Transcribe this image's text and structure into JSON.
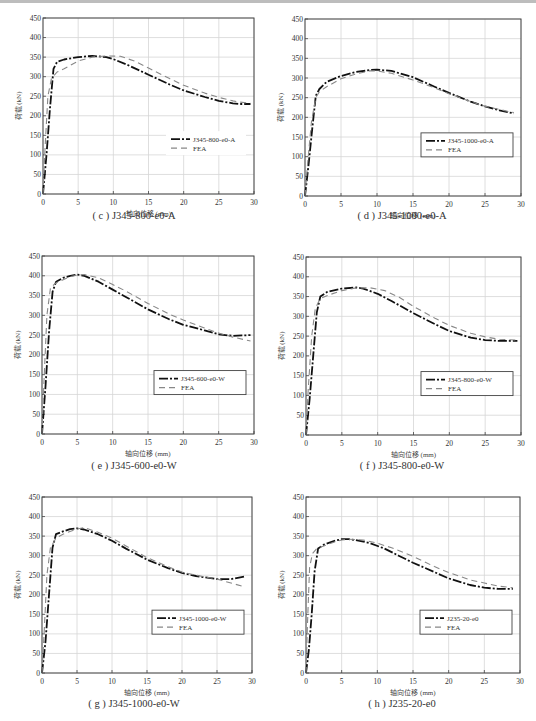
{
  "figure": {
    "caption_partial": "图 — 轴心受压构件荷载-轴向位移曲线试验与有限元对比",
    "xlabel": "轴向位移 (mm)",
    "ylabel": "荷载 (kN)"
  },
  "panels": [
    {
      "id": "c",
      "caption": "( c ) J345-800-e0-A",
      "legend": [
        "J345-800-e0-A",
        "FEA"
      ],
      "legend_box": false
    },
    {
      "id": "d",
      "caption": "( d ) J345-1000-e0-A",
      "legend": [
        "J345-1000-e0-A",
        "FEA"
      ],
      "legend_box": true
    },
    {
      "id": "e",
      "caption": "( e ) J345-600-e0-W",
      "legend": [
        "J345-600-e0-W",
        "FEA"
      ],
      "legend_box": true
    },
    {
      "id": "f",
      "caption": "( f ) J345-800-e0-W",
      "legend": [
        "J345-800-e0-W",
        "FEA"
      ],
      "legend_box": true
    },
    {
      "id": "g",
      "caption": "( g ) J345-1000-e0-W",
      "legend": [
        "J345-1000-e0-W",
        "FEA"
      ],
      "legend_box": true
    },
    {
      "id": "h",
      "caption": "( h ) J235-20-e0",
      "legend": [
        "J235-20-e0",
        "FEA"
      ],
      "legend_box": true
    }
  ],
  "chart_data": [
    {
      "type": "line",
      "title": "(c) J345-800-e0-A",
      "xlabel": "轴向位移 (mm)",
      "ylabel": "荷载 (kN)",
      "xlim": [
        0,
        30
      ],
      "ylim": [
        0,
        450
      ],
      "xticks": [
        0,
        5,
        10,
        15,
        20,
        25,
        30
      ],
      "yticks": [
        0,
        50,
        100,
        150,
        200,
        250,
        300,
        350,
        400,
        450
      ],
      "grid": true,
      "legend_position": "lower right",
      "series": [
        {
          "name": "J345-800-e0-A",
          "style": "dash-dot",
          "x": [
            0,
            0.5,
            1,
            1.5,
            2,
            3,
            5,
            7,
            9,
            10,
            12,
            15,
            18,
            20,
            23,
            25,
            27,
            28,
            29.5
          ],
          "y": [
            0,
            100,
            220,
            320,
            338,
            344,
            350,
            353,
            350,
            345,
            330,
            305,
            280,
            265,
            248,
            238,
            232,
            230,
            230
          ]
        },
        {
          "name": "FEA",
          "style": "dashed",
          "x": [
            0,
            0.3,
            0.7,
            1.2,
            2,
            3,
            5,
            7,
            9,
            11,
            13,
            15,
            18,
            20,
            23,
            25,
            27,
            28,
            29.5
          ],
          "y": [
            0,
            120,
            250,
            295,
            312,
            320,
            340,
            350,
            353,
            352,
            340,
            322,
            295,
            278,
            258,
            247,
            238,
            235,
            232
          ]
        }
      ]
    },
    {
      "type": "line",
      "title": "(d) J345-1000-e0-A",
      "xlabel": "轴向位移 (mm)",
      "ylabel": "荷载 (kN)",
      "xlim": [
        0,
        30
      ],
      "ylim": [
        0,
        450
      ],
      "xticks": [
        0,
        5,
        10,
        15,
        20,
        25,
        30
      ],
      "yticks": [
        0,
        50,
        100,
        150,
        200,
        250,
        300,
        350,
        400,
        450
      ],
      "grid": true,
      "legend_position": "lower right",
      "series": [
        {
          "name": "J345-1000-e0-A",
          "style": "dash-dot",
          "x": [
            0,
            0.5,
            1,
            1.5,
            2,
            3,
            5,
            7,
            9,
            10,
            12,
            15,
            18,
            20,
            23,
            25,
            27,
            29
          ],
          "y": [
            0,
            80,
            170,
            255,
            272,
            290,
            305,
            315,
            320,
            321,
            318,
            302,
            278,
            262,
            240,
            228,
            218,
            210
          ]
        },
        {
          "name": "FEA",
          "style": "dashed",
          "x": [
            0,
            0.4,
            0.9,
            1.5,
            2,
            3,
            5,
            7,
            9,
            10,
            12,
            15,
            18,
            20,
            23,
            25,
            27,
            29
          ],
          "y": [
            0,
            90,
            190,
            250,
            265,
            278,
            298,
            310,
            318,
            318,
            312,
            295,
            275,
            260,
            240,
            228,
            220,
            212
          ]
        }
      ]
    },
    {
      "type": "line",
      "title": "(e) J345-600-e0-W",
      "xlabel": "轴向位移 (mm)",
      "ylabel": "荷载 (kN)",
      "xlim": [
        0,
        30
      ],
      "ylim": [
        0,
        450
      ],
      "xticks": [
        0,
        5,
        10,
        15,
        20,
        25,
        30
      ],
      "yticks": [
        0,
        50,
        100,
        150,
        200,
        250,
        300,
        350,
        400,
        450
      ],
      "grid": true,
      "legend_position": "lower right",
      "series": [
        {
          "name": "J345-600-e0-W",
          "style": "dash-dot",
          "x": [
            0,
            0.5,
            1,
            1.5,
            2,
            3,
            4,
            5,
            6,
            8,
            10,
            12,
            15,
            18,
            20,
            23,
            25,
            27,
            29.5
          ],
          "y": [
            0,
            120,
            260,
            360,
            385,
            395,
            400,
            403,
            400,
            385,
            365,
            345,
            315,
            290,
            276,
            262,
            252,
            248,
            250
          ]
        },
        {
          "name": "FEA",
          "style": "dashed",
          "x": [
            0,
            0.3,
            0.7,
            1.2,
            2,
            3,
            4,
            5,
            6,
            8,
            10,
            12,
            15,
            18,
            20,
            23,
            25,
            27,
            29.5
          ],
          "y": [
            0,
            140,
            300,
            370,
            382,
            390,
            398,
            402,
            403,
            395,
            378,
            360,
            330,
            303,
            288,
            268,
            255,
            245,
            235
          ]
        }
      ]
    },
    {
      "type": "line",
      "title": "(f) J345-800-e0-W",
      "xlabel": "轴向位移 (mm)",
      "ylabel": "荷载 (kN)",
      "xlim": [
        0,
        30
      ],
      "ylim": [
        0,
        450
      ],
      "xticks": [
        0,
        5,
        10,
        15,
        20,
        25,
        30
      ],
      "yticks": [
        0,
        50,
        100,
        150,
        200,
        250,
        300,
        350,
        400,
        450
      ],
      "grid": true,
      "legend_position": "lower right",
      "series": [
        {
          "name": "J345-800-e0-W",
          "style": "dash-dot",
          "x": [
            0,
            0.5,
            1,
            1.5,
            2,
            3,
            5,
            7,
            8,
            10,
            12,
            15,
            18,
            20,
            23,
            25,
            27,
            29.5
          ],
          "y": [
            0,
            90,
            200,
            310,
            350,
            362,
            370,
            373,
            370,
            357,
            338,
            308,
            280,
            263,
            246,
            240,
            238,
            238
          ]
        },
        {
          "name": "FEA",
          "style": "dashed",
          "x": [
            0,
            0.3,
            0.8,
            1.3,
            2,
            3,
            5,
            7,
            9,
            11,
            13,
            15,
            18,
            20,
            23,
            25,
            27,
            29.5
          ],
          "y": [
            0,
            110,
            250,
            320,
            345,
            353,
            365,
            372,
            372,
            365,
            348,
            325,
            295,
            277,
            257,
            248,
            242,
            240
          ]
        }
      ]
    },
    {
      "type": "line",
      "title": "(g) J345-1000-e0-W",
      "xlabel": "轴向位移 (mm)",
      "ylabel": "荷载 (kN)",
      "xlim": [
        0,
        30
      ],
      "ylim": [
        0,
        450
      ],
      "xticks": [
        0,
        5,
        10,
        15,
        20,
        25,
        30
      ],
      "yticks": [
        0,
        50,
        100,
        150,
        200,
        250,
        300,
        350,
        400,
        450
      ],
      "grid": true,
      "legend_position": "lower right",
      "series": [
        {
          "name": "J345-1000-e0-W",
          "style": "dash-dot",
          "x": [
            0,
            0.5,
            1,
            1.5,
            2,
            3,
            4,
            5,
            6,
            8,
            10,
            12,
            15,
            18,
            20,
            22,
            25,
            27,
            29
          ],
          "y": [
            0,
            80,
            200,
            320,
            355,
            362,
            368,
            370,
            367,
            355,
            338,
            318,
            290,
            268,
            256,
            248,
            240,
            240,
            247
          ]
        },
        {
          "name": "FEA",
          "style": "dashed",
          "x": [
            0,
            0.3,
            0.7,
            1.2,
            2,
            3,
            4,
            5,
            6,
            8,
            10,
            12,
            15,
            18,
            20,
            22,
            25,
            27,
            29
          ],
          "y": [
            0,
            100,
            250,
            320,
            345,
            355,
            362,
            368,
            372,
            360,
            345,
            325,
            295,
            272,
            258,
            250,
            240,
            230,
            220
          ]
        }
      ]
    },
    {
      "type": "line",
      "title": "(h) J235-20-e0",
      "xlabel": "轴向位移 (mm)",
      "ylabel": "荷载 (kN)",
      "xlim": [
        0,
        30
      ],
      "ylim": [
        0,
        450
      ],
      "xticks": [
        0,
        5,
        10,
        15,
        20,
        25,
        30
      ],
      "yticks": [
        0,
        50,
        100,
        150,
        200,
        250,
        300,
        350,
        400,
        450
      ],
      "grid": true,
      "legend_position": "lower right",
      "series": [
        {
          "name": "J235-20-e0",
          "style": "dash-dot",
          "x": [
            0,
            0.4,
            0.8,
            1.2,
            1.7,
            2.5,
            4,
            5,
            6,
            7,
            9,
            11,
            13,
            15,
            18,
            20,
            23,
            25,
            27,
            29
          ],
          "y": [
            0,
            60,
            150,
            260,
            318,
            328,
            338,
            342,
            342,
            340,
            332,
            318,
            300,
            282,
            258,
            242,
            225,
            218,
            215,
            215
          ]
        },
        {
          "name": "FEA",
          "style": "dashed",
          "x": [
            0,
            0.2,
            0.5,
            0.9,
            1.5,
            2.5,
            4,
            5,
            6,
            8,
            10,
            12,
            15,
            18,
            20,
            23,
            25,
            27,
            29
          ],
          "y": [
            0,
            120,
            270,
            305,
            318,
            325,
            335,
            340,
            342,
            340,
            332,
            320,
            298,
            272,
            257,
            238,
            230,
            222,
            218
          ]
        }
      ]
    }
  ]
}
